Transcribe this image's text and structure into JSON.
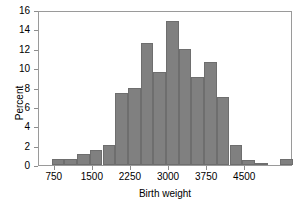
{
  "chart_data": {
    "type": "bar",
    "title": "",
    "subtitle": "",
    "xlabel": "Birth weight",
    "ylabel": "Percent",
    "grid": false,
    "legend": null,
    "xlim": [
      440,
      5440
    ],
    "ylim": [
      0,
      16
    ],
    "bin_width": 250,
    "xticks": [
      750,
      1500,
      2250,
      3000,
      3750,
      4500
    ],
    "xtick_labels": [
      "750",
      "1500",
      "2250",
      "3000",
      "3750",
      "4500"
    ],
    "yticks": [
      0,
      2,
      4,
      6,
      8,
      10,
      12,
      14,
      16
    ],
    "ytick_labels": [
      "0",
      "2",
      "4",
      "6",
      "8",
      "10",
      "12",
      "14",
      "16"
    ],
    "bar_color": "#808080",
    "bar_edge_color": "#6e6e6e",
    "frame_color": "#9a9a9a",
    "bin_starts": [
      690,
      940,
      1190,
      1440,
      1690,
      1940,
      2190,
      2440,
      2690,
      2940,
      3190,
      3440,
      3690,
      3940,
      4190,
      4440,
      4690,
      4940,
      5190
    ],
    "bin_centers": [
      815,
      1065,
      1315,
      1565,
      1815,
      2065,
      2315,
      2565,
      2815,
      3065,
      3315,
      3565,
      3815,
      4065,
      4315,
      4565,
      4815,
      5065,
      5315
    ],
    "values": [
      0.6,
      0.6,
      1.1,
      1.6,
      2.1,
      7.4,
      8.0,
      12.6,
      9.6,
      14.9,
      12.0,
      9.1,
      10.6,
      7.0,
      2.1,
      0.5,
      0.1,
      0.0,
      0.6
    ],
    "categories": [
      "690-940",
      "940-1190",
      "1190-1440",
      "1440-1690",
      "1690-1940",
      "1940-2190",
      "2190-2440",
      "2440-2690",
      "2690-2940",
      "2940-3190",
      "3190-3440",
      "3440-3690",
      "3690-3940",
      "3940-4190",
      "4190-4440",
      "4440-4690",
      "4690-4940",
      "4940-5190",
      "5190-5440"
    ]
  }
}
